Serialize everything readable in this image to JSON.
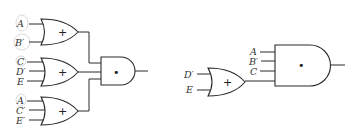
{
  "diagram": {
    "left_circuit": {
      "or_gates": [
        {
          "symbol": "+",
          "inputs": [
            "A",
            "B′"
          ]
        },
        {
          "symbol": "+",
          "inputs": [
            "C",
            "D′",
            "E"
          ]
        },
        {
          "symbol": "+",
          "inputs": [
            "A",
            "C′",
            "E′"
          ]
        }
      ],
      "and_gate": {
        "symbol": "•"
      },
      "circled_literals": [
        "A",
        "B′",
        "C",
        "A"
      ]
    },
    "right_circuit": {
      "and_gate": {
        "symbol": "•",
        "inputs": [
          "A",
          "B′",
          "C"
        ]
      },
      "or_gate": {
        "symbol": "+",
        "inputs": [
          "D′",
          "E"
        ]
      }
    },
    "colors": {
      "line": "#2a2a2a",
      "circle_highlight": "#cfcfcf",
      "background": "#ffffff"
    }
  }
}
